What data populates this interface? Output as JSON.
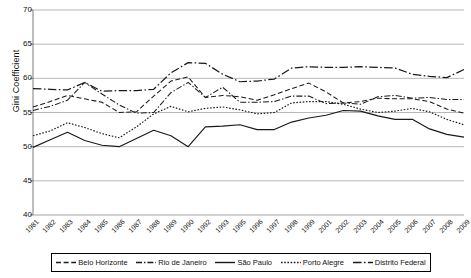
{
  "chart_data": {
    "type": "line",
    "title": "",
    "xlabel": "",
    "ylabel": "Gini Coefficient",
    "ylim": [
      40,
      70
    ],
    "yticks": [
      40,
      45,
      50,
      55,
      60,
      65,
      70
    ],
    "grid": true,
    "legend_position": "bottom",
    "categories": [
      "1981",
      "1982",
      "1983",
      "1984",
      "1985",
      "1986",
      "1987",
      "1988",
      "1989",
      "1990",
      "1992",
      "1993",
      "1995",
      "1996",
      "1997",
      "1998",
      "1999",
      "2001",
      "2002",
      "2003",
      "2004",
      "2005",
      "2006",
      "2007",
      "2008",
      "2009"
    ],
    "series": [
      {
        "name": "Belo Horizonte",
        "style": "dashed",
        "values": [
          55.8,
          56.6,
          57.5,
          57.0,
          56.5,
          55.0,
          55.1,
          57.4,
          59.6,
          60.2,
          57.2,
          57.5,
          57.3,
          56.8,
          57.6,
          58.5,
          59.3,
          58.0,
          56.4,
          56.6,
          57.1,
          57.0,
          57.0,
          56.6,
          55.5,
          54.9
        ]
      },
      {
        "name": "Rio de Janeiro",
        "style": "dash-dot",
        "values": [
          55.3,
          55.9,
          56.8,
          59.4,
          57.7,
          56.1,
          54.9,
          55.0,
          57.9,
          59.4,
          57.2,
          58.7,
          56.5,
          56.5,
          56.6,
          57.4,
          57.4,
          56.3,
          56.4,
          56.2,
          57.3,
          57.5,
          57.1,
          57.2,
          56.9,
          56.9
        ]
      },
      {
        "name": "São Paulo",
        "style": "solid",
        "values": [
          49.9,
          51.0,
          52.1,
          50.9,
          50.2,
          50.0,
          51.2,
          52.4,
          51.6,
          50.0,
          52.9,
          53.0,
          53.2,
          52.5,
          52.5,
          53.6,
          54.2,
          54.6,
          55.3,
          55.2,
          54.5,
          54.0,
          54.0,
          52.6,
          51.8,
          51.4
        ]
      },
      {
        "name": "Porto Alegre",
        "style": "dotted",
        "values": [
          51.6,
          52.3,
          53.5,
          52.8,
          51.9,
          51.3,
          52.9,
          54.8,
          55.9,
          55.1,
          55.6,
          55.8,
          55.4,
          54.8,
          55.0,
          56.4,
          56.6,
          56.6,
          56.2,
          55.5,
          55.0,
          55.2,
          55.6,
          55.1,
          54.0,
          53.2
        ]
      },
      {
        "name": "Distrito Federal",
        "style": "dash-dot-wide",
        "values": [
          58.5,
          58.4,
          58.3,
          59.4,
          58.1,
          58.2,
          58.2,
          58.4,
          60.8,
          62.3,
          62.2,
          60.6,
          59.5,
          59.6,
          59.9,
          61.5,
          61.7,
          61.6,
          61.6,
          61.7,
          61.6,
          61.5,
          60.6,
          60.3,
          60.1,
          61.3
        ]
      }
    ]
  },
  "legend": {
    "items": [
      {
        "label": "Belo Horizonte"
      },
      {
        "label": "Rio de Janeiro"
      },
      {
        "label": "São Paulo"
      },
      {
        "label": "Porto Alegre"
      },
      {
        "label": "Distrito Federal"
      }
    ]
  },
  "axis": {
    "y_title": "Gini Coefficient"
  },
  "colors": {
    "line": "#1a1a1a",
    "grid": "#9a9a9a",
    "axis": "#6e6e6e",
    "text": "#111111",
    "background": "#ffffff"
  }
}
